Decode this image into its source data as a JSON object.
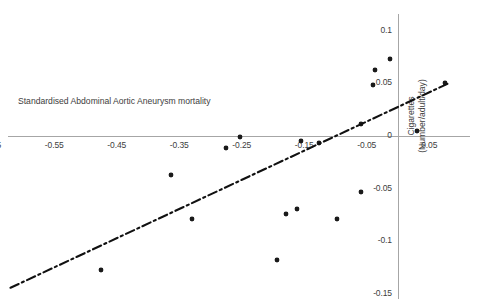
{
  "chart_data": {
    "type": "scatter",
    "title": "Standardised Abdominal Aortic Aneurysm mortality",
    "xlabel": "Standardised Abdominal Aortic Aneurysm mortality",
    "ylabel_line1": "Cigarettes",
    "ylabel_line2": "(Number/adult/day)",
    "xlim": [
      -0.7,
      0.09
    ],
    "ylim": [
      -0.15,
      0.105
    ],
    "grid": false,
    "legend": false,
    "x_ticks": [
      -0.65,
      -0.55,
      -0.45,
      -0.35,
      -0.25,
      -0.15,
      -0.05,
      0.05
    ],
    "x_tick_labels": [
      "-0.65",
      "-0.55",
      "-0.45",
      "-0.35",
      "-0.25",
      "-0.15",
      "-0.05",
      "0.05"
    ],
    "y_ticks": [
      0.1,
      0.05,
      0,
      -0.05,
      -0.1,
      -0.15
    ],
    "y_tick_labels": [
      "0.1",
      "0.05",
      "0",
      "-0.05",
      "-0.1",
      "-0.15"
    ],
    "points": [
      {
        "x": -0.65,
        "y": -0.126
      },
      {
        "x": -0.475,
        "y": -0.127
      },
      {
        "x": -0.363,
        "y": -0.037
      },
      {
        "x": -0.33,
        "y": -0.079
      },
      {
        "x": -0.275,
        "y": -0.011
      },
      {
        "x": -0.253,
        "y": -0.001
      },
      {
        "x": -0.194,
        "y": -0.118
      },
      {
        "x": -0.179,
        "y": -0.074
      },
      {
        "x": -0.161,
        "y": -0.069
      },
      {
        "x": -0.155,
        "y": -0.005
      },
      {
        "x": -0.127,
        "y": -0.007
      },
      {
        "x": -0.098,
        "y": -0.079
      },
      {
        "x": -0.06,
        "y": 0.011
      },
      {
        "x": -0.059,
        "y": -0.053
      },
      {
        "x": -0.04,
        "y": 0.048
      },
      {
        "x": -0.037,
        "y": 0.063
      },
      {
        "x": -0.013,
        "y": 0.073
      },
      {
        "x": 0.03,
        "y": 0.005
      },
      {
        "x": 0.075,
        "y": 0.05
      }
    ],
    "trendline": {
      "style": "dash-dot",
      "color": "#111111",
      "x_start": -0.62,
      "y_start": -0.144,
      "x_end": 0.081,
      "y_end": 0.05
    }
  }
}
